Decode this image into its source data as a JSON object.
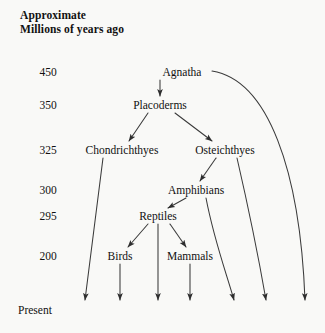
{
  "diagram": {
    "title_line1": "Approximate",
    "title_line2": "Millions of years ago",
    "present_label": "Present",
    "background_color": "#f9f9f7",
    "line_color": "#3a3a3a",
    "text_color": "#111111"
  },
  "time_axis": {
    "unit": "millions of years ago",
    "labels": [
      {
        "value": "450",
        "x": 48,
        "y": 72
      },
      {
        "value": "350",
        "x": 48,
        "y": 105
      },
      {
        "value": "325",
        "x": 48,
        "y": 150
      },
      {
        "value": "300",
        "x": 48,
        "y": 190
      },
      {
        "value": "295",
        "x": 48,
        "y": 216
      },
      {
        "value": "200",
        "x": 48,
        "y": 256
      },
      {
        "value": "Present",
        "x": 18,
        "y": 310
      }
    ]
  },
  "taxa": [
    {
      "id": "agnatha",
      "label": "Agnatha",
      "x": 182,
      "y": 72,
      "period": "450"
    },
    {
      "id": "placoderms",
      "label": "Placoderms",
      "x": 160,
      "y": 105,
      "period": "350"
    },
    {
      "id": "chondrichthyes",
      "label": "Chondrichthyes",
      "x": 122,
      "y": 150,
      "period": "325"
    },
    {
      "id": "osteichthyes",
      "label": "Osteichthyes",
      "x": 225,
      "y": 150,
      "period": "325"
    },
    {
      "id": "amphibians",
      "label": "Amphibians",
      "x": 196,
      "y": 190,
      "period": "300"
    },
    {
      "id": "reptiles",
      "label": "Reptiles",
      "x": 158,
      "y": 216,
      "period": "295"
    },
    {
      "id": "birds",
      "label": "Birds",
      "x": 120,
      "y": 256,
      "period": "200"
    },
    {
      "id": "mammals",
      "label": "Mammals",
      "x": 190,
      "y": 256,
      "period": "200"
    }
  ],
  "lineages": [
    {
      "from": "agnatha",
      "to": "placoderms",
      "type": "descent-arrow"
    },
    {
      "from": "placoderms",
      "to": "chondrichthyes",
      "type": "descent-arrow"
    },
    {
      "from": "placoderms",
      "to": "osteichthyes",
      "type": "descent-arrow"
    },
    {
      "from": "osteichthyes",
      "to": "amphibians",
      "type": "descent-arrow"
    },
    {
      "from": "amphibians",
      "to": "reptiles",
      "type": "descent-arrow"
    },
    {
      "from": "reptiles",
      "to": "birds",
      "type": "descent-arrow"
    },
    {
      "from": "reptiles",
      "to": "mammals",
      "type": "descent-arrow"
    }
  ],
  "survivor_lines": [
    {
      "id": "chondrichthyes-present",
      "taxon": "chondrichthyes",
      "terminus_x": 85
    },
    {
      "id": "birds-present",
      "taxon": "birds",
      "terminus_x": 120
    },
    {
      "id": "reptiles-present",
      "taxon": "reptiles",
      "terminus_x": 158
    },
    {
      "id": "mammals-present",
      "taxon": "mammals",
      "terminus_x": 190
    },
    {
      "id": "amphibians-present",
      "taxon": "amphibians",
      "terminus_x": 234
    },
    {
      "id": "osteichthyes-present",
      "taxon": "osteichthyes",
      "terminus_x": 266
    },
    {
      "id": "agnatha-present",
      "taxon": "agnatha",
      "terminus_x": 305
    }
  ]
}
